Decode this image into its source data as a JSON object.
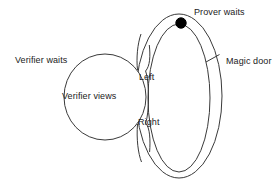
{
  "diagram": {
    "colors": {
      "stroke": "#3a3a3a",
      "fill": "#ffffff",
      "marker": "#000000",
      "text": "#222222"
    },
    "labels": {
      "prover_waits": "Prover waits",
      "magic_door": "Magic door",
      "verifier_waits": "Verifier waits",
      "verifier_views": "Verifier views",
      "left_path": "Left",
      "right_path": "Right"
    },
    "shapes": {
      "verifier_circle": {
        "name": "verifier-chamber",
        "cx": 105,
        "cy": 97,
        "rx": 41,
        "ry": 43
      },
      "outer_loop": {
        "name": "cave-outer-wall",
        "cx": 179,
        "cy": 96,
        "rx": 43,
        "ry": 82
      },
      "inner_loop": {
        "name": "cave-inner-wall",
        "cx": 179,
        "cy": 98,
        "rx": 31,
        "ry": 74
      },
      "prover_marker": {
        "name": "prover-position-dot",
        "cx": 181,
        "cy": 23,
        "r": 5
      },
      "magic_door_line": {
        "name": "magic-door-barrier",
        "x1": 206,
        "y1": 62,
        "x2": 219,
        "y2": 55
      }
    }
  }
}
